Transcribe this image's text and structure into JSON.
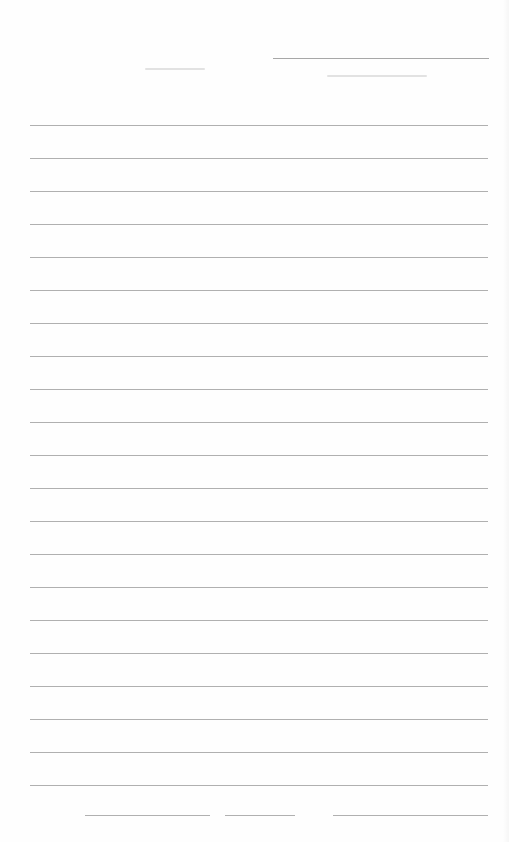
{
  "page": {
    "type": "ruled notebook page",
    "background": "#ffffff",
    "rule_color": "#8f8f8f",
    "header": {
      "line": {
        "x": 273,
        "y": 58,
        "width": 216
      },
      "faint_marks": [
        {
          "x": 145,
          "y": 68,
          "width": 60
        },
        {
          "x": 327,
          "y": 75,
          "width": 100
        }
      ]
    },
    "rules": {
      "left": 30,
      "right": 488,
      "first_y": 125,
      "spacing": 33,
      "count": 21
    },
    "last_rule": {
      "y": 815,
      "segments": [
        {
          "x": 85,
          "width": 125
        },
        {
          "x": 225,
          "width": 70
        },
        {
          "x": 333,
          "width": 155
        }
      ]
    }
  }
}
